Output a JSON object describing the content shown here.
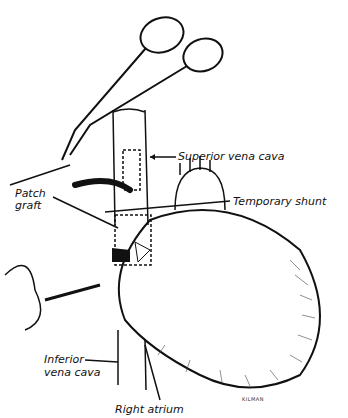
{
  "figure": {
    "type": "surgical illustration",
    "labels": {
      "superior_vena_cava": "Superior vena cava",
      "patch_graft_line1": "Patch",
      "patch_graft_line2": "graft",
      "temporary_shunt": "Temporary shunt",
      "inferior_vena_cava_line1": "Inferior",
      "inferior_vena_cava_line2": "vena cava",
      "right_atrium": "Right atrium"
    },
    "signature": "KILMAN"
  }
}
